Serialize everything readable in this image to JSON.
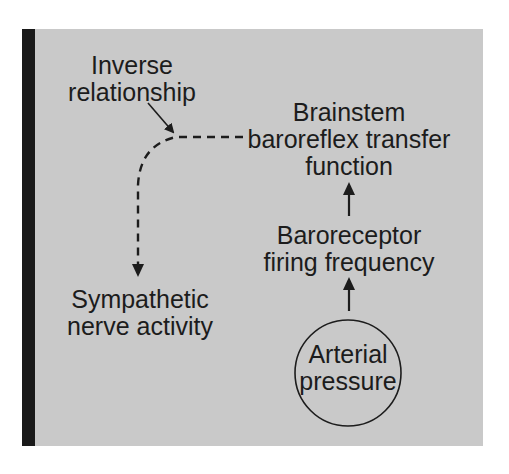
{
  "diagram": {
    "colors": {
      "panel_background": "#c9c9c9",
      "side_bar": "#1a1a1a",
      "ink": "#1c1c1c",
      "page_background": "#ffffff"
    },
    "nodes": {
      "inverse_relationship": {
        "line1": "Inverse",
        "line2": "relationship"
      },
      "brainstem": {
        "line1": "Brainstem",
        "line2": "baroreflex transfer",
        "line3": "function"
      },
      "baroreceptor": {
        "line1": "Baroreceptor",
        "line2": "firing frequency"
      },
      "sympathetic": {
        "line1": "Sympathetic",
        "line2": "nerve activity"
      },
      "arterial_pressure": {
        "line1": "Arterial",
        "line2": "pressure",
        "shape": "circle"
      }
    },
    "edges": [
      {
        "from": "arterial_pressure",
        "to": "baroreceptor",
        "style": "solid"
      },
      {
        "from": "baroreceptor",
        "to": "brainstem",
        "style": "solid"
      },
      {
        "from": "brainstem",
        "to": "sympathetic",
        "style": "dashed"
      },
      {
        "from": "inverse_relationship",
        "to": "brainstem-sympathetic-dashed-edge",
        "style": "solid",
        "kind": "annotation-pointer"
      }
    ]
  }
}
